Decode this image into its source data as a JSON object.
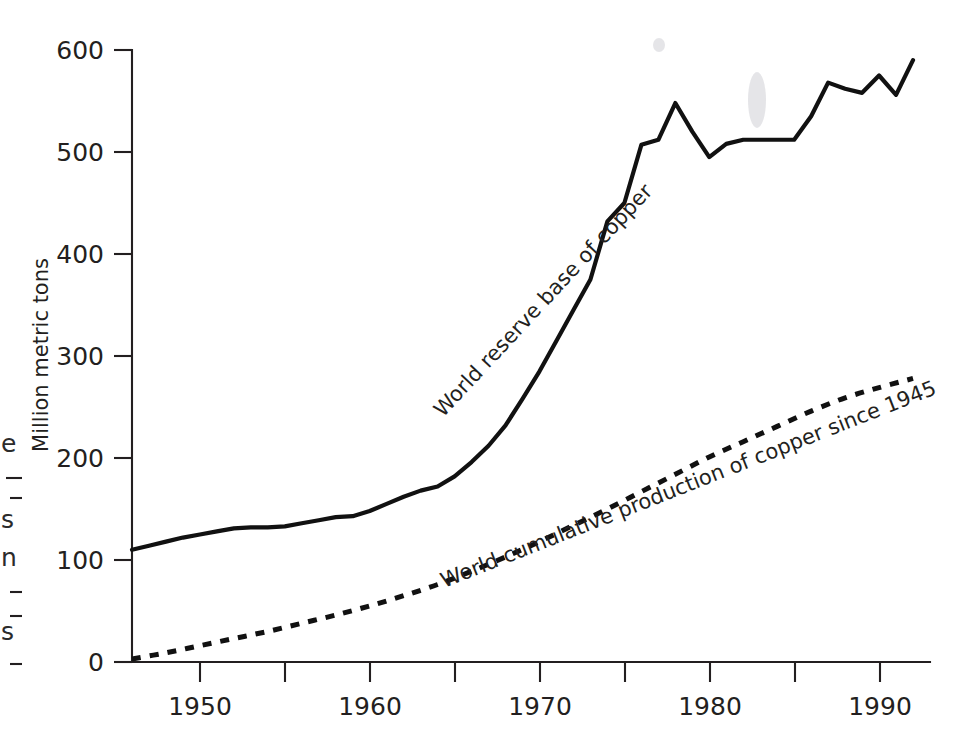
{
  "figure": {
    "background_color": "#ffffff",
    "ink_color": "#231f20"
  },
  "chart_data": {
    "type": "line",
    "title": "",
    "subtitle": "",
    "xlabel": "",
    "ylabel": "Million metric tons",
    "xlim": [
      1946,
      1993
    ],
    "ylim": [
      0,
      600
    ],
    "grid": false,
    "legend_position": "inline-annotations",
    "x_ticks": [
      1950,
      1955,
      1960,
      1965,
      1970,
      1975,
      1980,
      1985,
      1990
    ],
    "x_tick_labels": [
      "1950",
      "",
      "1960",
      "",
      "1970",
      "",
      "1980",
      "",
      "1990"
    ],
    "y_ticks": [
      0,
      100,
      200,
      300,
      400,
      500,
      600
    ],
    "y_tick_labels": [
      "0",
      "100",
      "200",
      "300",
      "400",
      "500",
      "600"
    ],
    "series": [
      {
        "name": "World reserve base of copper",
        "style": "solid",
        "annotation": "World reserve base of copper",
        "x": [
          1946,
          1947,
          1948,
          1949,
          1950,
          1951,
          1952,
          1953,
          1954,
          1955,
          1956,
          1957,
          1958,
          1959,
          1960,
          1961,
          1962,
          1963,
          1964,
          1965,
          1966,
          1967,
          1968,
          1969,
          1970,
          1971,
          1972,
          1973,
          1974,
          1975,
          1976,
          1977,
          1978,
          1979,
          1980,
          1981,
          1982,
          1983,
          1984,
          1985,
          1986,
          1987,
          1988,
          1989,
          1990,
          1991,
          1992
        ],
        "values": [
          110,
          114,
          118,
          122,
          125,
          128,
          131,
          132,
          132,
          133,
          136,
          139,
          142,
          143,
          148,
          155,
          162,
          168,
          172,
          182,
          196,
          212,
          232,
          258,
          285,
          315,
          345,
          375,
          432,
          450,
          507,
          512,
          548,
          520,
          495,
          508,
          512,
          512,
          512,
          512,
          535,
          568,
          562,
          558,
          575,
          556,
          590
        ]
      },
      {
        "name": "World cumulative production of copper since 1945",
        "style": "dashed",
        "annotation": "World cumulative production of copper since 1945",
        "x": [
          1946,
          1948,
          1950,
          1952,
          1954,
          1956,
          1958,
          1960,
          1962,
          1964,
          1966,
          1968,
          1970,
          1972,
          1974,
          1976,
          1978,
          1980,
          1982,
          1984,
          1986,
          1988,
          1990,
          1992
        ],
        "values": [
          3,
          9,
          16,
          23,
          30,
          38,
          46,
          55,
          65,
          76,
          89,
          103,
          118,
          134,
          150,
          167,
          184,
          201,
          216,
          231,
          246,
          259,
          269,
          278
        ]
      }
    ]
  },
  "annotations": {
    "series_solid_label": "World reserve base of copper",
    "series_dashed_label": "World cumulative production of copper since 1945",
    "y_axis_title": "Million metric tons"
  },
  "edge_fragments": {
    "note": "Clipped glyphs from a neighbouring figure at the left page margin",
    "glyphs": [
      "e",
      "s",
      "n",
      "s"
    ]
  }
}
